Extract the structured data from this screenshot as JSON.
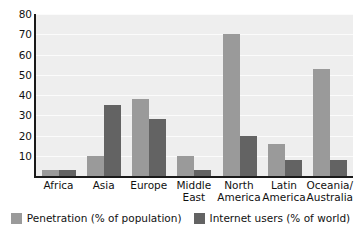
{
  "chart_data": {
    "type": "bar",
    "title": "",
    "subtitle": "",
    "xlabel": "",
    "ylabel": "",
    "ylim": [
      0,
      80
    ],
    "yticks": [
      10,
      20,
      30,
      40,
      50,
      60,
      70,
      80
    ],
    "grid": true,
    "legend_position": "bottom",
    "categories": [
      "Africa",
      "Asia",
      "Europe",
      "Middle East",
      "North America",
      "Latin America",
      "Oceania/Australia"
    ],
    "category_lines": [
      [
        "Africa"
      ],
      [
        "Asia"
      ],
      [
        "Europe"
      ],
      [
        "Middle",
        "East"
      ],
      [
        "North",
        "America"
      ],
      [
        "Latin",
        "America"
      ],
      [
        "Oceania/",
        "Australia"
      ]
    ],
    "series": [
      {
        "name": "Penetration (% of population)",
        "color": "#9a9a9a",
        "values": [
          3,
          10,
          38,
          10,
          70,
          16,
          53
        ]
      },
      {
        "name": "Internet users (% of world)",
        "color": "#636363",
        "values": [
          3,
          35,
          28,
          3,
          20,
          8,
          8
        ]
      }
    ]
  },
  "legend": {
    "items": [
      {
        "label": "Penetration (% of population)"
      },
      {
        "label": "Internet users (% of world)"
      }
    ]
  },
  "axes": {
    "y_tick_labels": [
      "80",
      "70",
      "60",
      "50",
      "40",
      "30",
      "20",
      "10"
    ]
  }
}
